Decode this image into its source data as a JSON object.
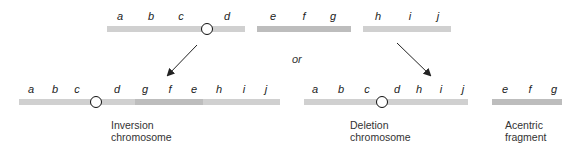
{
  "diagram": {
    "type": "chromosome-rearrangement",
    "top": {
      "segments": [
        {
          "genes": [
            "a",
            "b",
            "c",
            "d"
          ],
          "has_centromere": true
        },
        {
          "genes": [
            "e",
            "f",
            "g"
          ],
          "has_centromere": false
        },
        {
          "genes": [
            "h",
            "i",
            "j"
          ],
          "has_centromere": false
        }
      ]
    },
    "connector": "or",
    "results": [
      {
        "caption_line1": "Inversion",
        "caption_line2": "chromosome",
        "genes": [
          "a",
          "b",
          "c",
          "d",
          "g",
          "f",
          "e",
          "h",
          "i",
          "j"
        ]
      },
      {
        "caption_line1": "Deletion",
        "caption_line2": "chromosome",
        "genes": [
          "a",
          "b",
          "c",
          "d",
          "h",
          "i",
          "j"
        ]
      },
      {
        "caption_line1": "Acentric",
        "caption_line2": "fragment",
        "genes": [
          "e",
          "f",
          "g"
        ]
      }
    ]
  },
  "colors": {
    "bar": "#d0d0d0",
    "bar_inverted": "#bdbdbd",
    "arrow": "#222222",
    "centromere": "#111111"
  }
}
